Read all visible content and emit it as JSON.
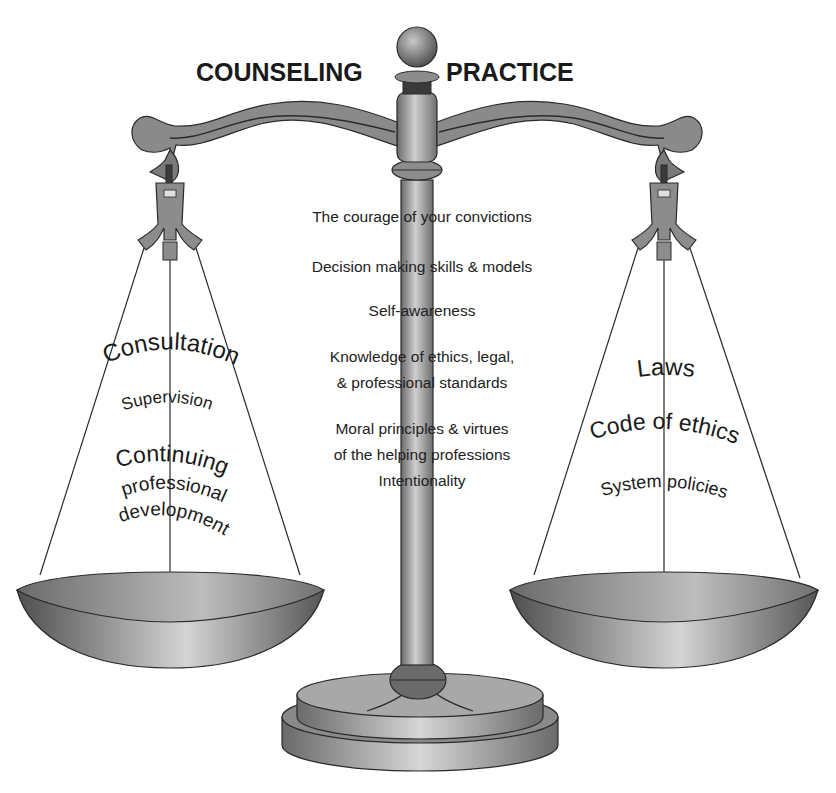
{
  "title": {
    "left": "COUNSELING",
    "right": "PRACTICE"
  },
  "center_items": [
    "The courage of your convictions",
    "Decision making skills & models",
    "Self-awareness",
    "Knowledge of ethics, legal,",
    "& professional standards",
    "Moral principles & virtues",
    "of the helping professions",
    "Intentionality"
  ],
  "left_pan": {
    "items": [
      "Consultation",
      "Supervision",
      "Continuing",
      "professional",
      "development"
    ]
  },
  "right_pan": {
    "items": [
      "Laws",
      "Code of ethics",
      "System policies"
    ]
  },
  "colors": {
    "metal_dark": "#5a5a5a",
    "metal_mid": "#8c8c8c",
    "metal_light": "#d8d8d8",
    "outline": "#2a2a2a",
    "text": "#1a1a1a"
  }
}
